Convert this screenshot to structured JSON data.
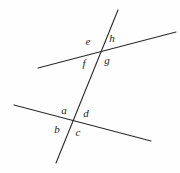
{
  "figure": {
    "type": "geometry-diagram",
    "background_color": "#fefefe",
    "stroke_color": "#2b2b2b",
    "label_color": "#1a1a1a",
    "width": 180,
    "height": 173
  },
  "lines": [
    {
      "name": "upper-line",
      "x1": 38,
      "y1": 68,
      "x2": 176,
      "y2": 32,
      "stroke_width": 1.1
    },
    {
      "name": "lower-line",
      "x1": 14,
      "y1": 105,
      "x2": 151,
      "y2": 141,
      "stroke_width": 1.1
    },
    {
      "name": "transversal-line",
      "x1": 118,
      "y1": 10,
      "x2": 56,
      "y2": 163,
      "stroke_width": 1.1
    }
  ],
  "intersections": [
    {
      "name": "upper-intersection",
      "x": 101,
      "y": 51
    },
    {
      "name": "lower-intersection",
      "x": 72,
      "y": 117
    }
  ],
  "labels": [
    {
      "name": "angle-label-e",
      "text": "e",
      "x": 88,
      "y": 41
    },
    {
      "name": "angle-label-h",
      "text": "h",
      "x": 112,
      "y": 38
    },
    {
      "name": "angle-label-f",
      "text": "f",
      "x": 84,
      "y": 63
    },
    {
      "name": "angle-label-g",
      "text": "g",
      "x": 107,
      "y": 60
    },
    {
      "name": "angle-label-a",
      "text": "a",
      "x": 64,
      "y": 110
    },
    {
      "name": "angle-label-d",
      "text": "d",
      "x": 86,
      "y": 113
    },
    {
      "name": "angle-label-b",
      "text": "b",
      "x": 57,
      "y": 129
    },
    {
      "name": "angle-label-c",
      "text": "c",
      "x": 78,
      "y": 132
    }
  ]
}
